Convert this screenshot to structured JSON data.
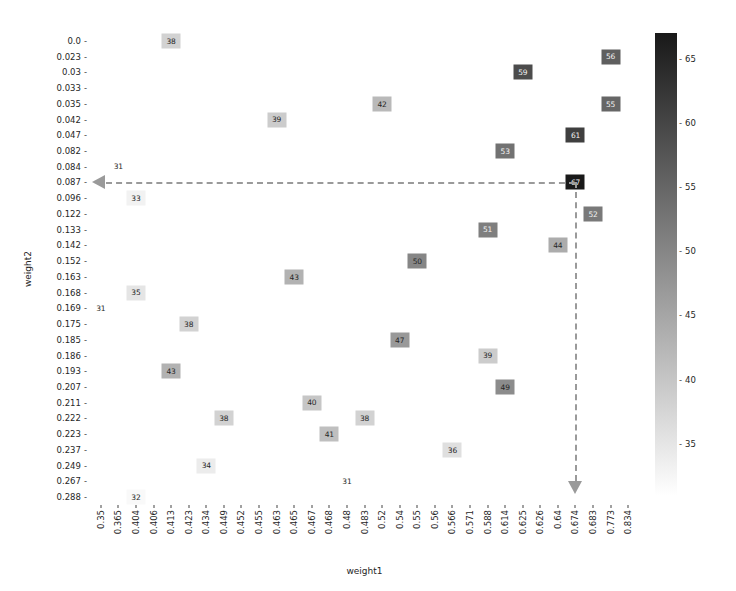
{
  "chart_data": {
    "type": "heatmap",
    "title": "",
    "xlabel": "weight1",
    "ylabel": "weight2",
    "x_categories": [
      "0.35",
      "0.365",
      "0.404",
      "0.406",
      "0.413",
      "0.423",
      "0.434",
      "0.449",
      "0.452",
      "0.455",
      "0.463",
      "0.465",
      "0.467",
      "0.468",
      "0.48",
      "0.483",
      "0.52",
      "0.54",
      "0.55",
      "0.56",
      "0.566",
      "0.571",
      "0.588",
      "0.614",
      "0.625",
      "0.626",
      "0.64",
      "0.674",
      "0.683",
      "0.773",
      "0.834"
    ],
    "y_categories": [
      "0.0",
      "0.023",
      "0.03",
      "0.033",
      "0.035",
      "0.042",
      "0.047",
      "0.082",
      "0.084",
      "0.087",
      "0.096",
      "0.122",
      "0.133",
      "0.142",
      "0.152",
      "0.163",
      "0.168",
      "0.169",
      "0.175",
      "0.185",
      "0.186",
      "0.193",
      "0.207",
      "0.211",
      "0.222",
      "0.223",
      "0.237",
      "0.249",
      "0.267",
      "0.288"
    ],
    "colorbar": {
      "ticks": [
        35,
        40,
        45,
        50,
        55,
        60,
        65
      ],
      "vmin": 31,
      "vmax": 67,
      "cmap": "grayscale-inverted",
      "low_color": "#ffffff",
      "high_color": "#1a1a1a"
    },
    "points": [
      {
        "x": "0.413",
        "y": "0.0",
        "value": 38
      },
      {
        "x": "0.625",
        "y": "0.03",
        "value": 59
      },
      {
        "x": "0.773",
        "y": "0.023",
        "value": 56
      },
      {
        "x": "0.773",
        "y": "0.035",
        "value": 55
      },
      {
        "x": "0.52",
        "y": "0.035",
        "value": 42
      },
      {
        "x": "0.463",
        "y": "0.042",
        "value": 39
      },
      {
        "x": "0.674",
        "y": "0.047",
        "value": 61
      },
      {
        "x": "0.614",
        "y": "0.082",
        "value": 53
      },
      {
        "x": "0.365",
        "y": "0.084",
        "value": 31
      },
      {
        "x": "0.674",
        "y": "0.087",
        "value": 67
      },
      {
        "x": "0.404",
        "y": "0.096",
        "value": 33
      },
      {
        "x": "0.683",
        "y": "0.122",
        "value": 52
      },
      {
        "x": "0.588",
        "y": "0.133",
        "value": 51
      },
      {
        "x": "0.64",
        "y": "0.142",
        "value": 44
      },
      {
        "x": "0.55",
        "y": "0.152",
        "value": 50
      },
      {
        "x": "0.465",
        "y": "0.163",
        "value": 43
      },
      {
        "x": "0.404",
        "y": "0.168",
        "value": 35
      },
      {
        "x": "0.35",
        "y": "0.169",
        "value": 31
      },
      {
        "x": "0.423",
        "y": "0.175",
        "value": 38
      },
      {
        "x": "0.54",
        "y": "0.185",
        "value": 47
      },
      {
        "x": "0.588",
        "y": "0.186",
        "value": 39
      },
      {
        "x": "0.413",
        "y": "0.193",
        "value": 43
      },
      {
        "x": "0.614",
        "y": "0.207",
        "value": 49
      },
      {
        "x": "0.467",
        "y": "0.211",
        "value": 40
      },
      {
        "x": "0.449",
        "y": "0.222",
        "value": 38
      },
      {
        "x": "0.483",
        "y": "0.222",
        "value": 38
      },
      {
        "x": "0.468",
        "y": "0.223",
        "value": 41
      },
      {
        "x": "0.566",
        "y": "0.237",
        "value": 36
      },
      {
        "x": "0.434",
        "y": "0.249",
        "value": 34
      },
      {
        "x": "0.48",
        "y": "0.267",
        "value": 31
      },
      {
        "x": "0.404",
        "y": "0.288",
        "value": 32
      }
    ],
    "annotations": [
      {
        "name": "horizontal-arrow",
        "direction": "left",
        "at_y": "0.087",
        "from_x": "0.674",
        "color": "#9a9a9a",
        "style": "dashed"
      },
      {
        "name": "vertical-arrow",
        "direction": "down",
        "at_x": "0.674",
        "from_y": "0.087",
        "color": "#9a9a9a",
        "style": "dashed"
      }
    ],
    "grid": false,
    "legend": "colorbar-right"
  }
}
